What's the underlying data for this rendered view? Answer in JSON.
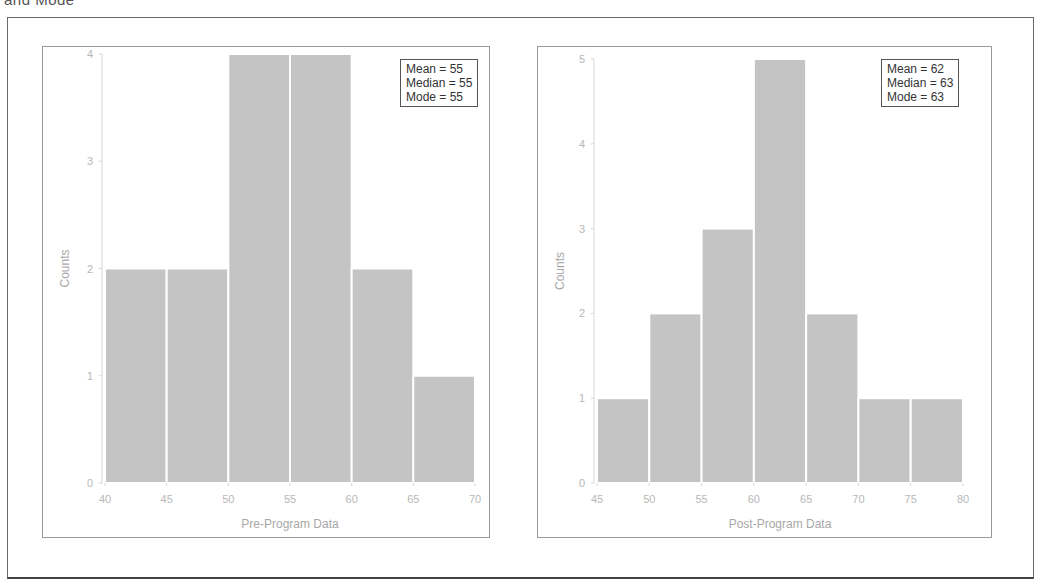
{
  "caption_fragment": "and Mode",
  "colors": {
    "bar_fill": "#c4c4c4",
    "bar_edge": "#ffffff",
    "axis": "#d6d6d6",
    "tick_text": "#b8b8b8",
    "frame": "#6a6a6a"
  },
  "chart_data": [
    {
      "type": "bar",
      "title": "",
      "xlabel": "Pre-Program Data",
      "ylabel": "Counts",
      "bins": [
        [
          40,
          45
        ],
        [
          45,
          50
        ],
        [
          50,
          55
        ],
        [
          55,
          60
        ],
        [
          60,
          65
        ],
        [
          65,
          70
        ]
      ],
      "categories": [
        "40-45",
        "45-50",
        "50-55",
        "55-60",
        "60-65",
        "65-70"
      ],
      "values": [
        2,
        2,
        4,
        4,
        2,
        1
      ],
      "xlim": [
        40,
        70
      ],
      "ylim": [
        0,
        4
      ],
      "xticks": [
        "40",
        "45",
        "50",
        "55",
        "60",
        "65",
        "70"
      ],
      "yticks": [
        "0",
        "1",
        "2",
        "3",
        "4"
      ],
      "grid": false,
      "annotation": {
        "mean": "Mean = 55",
        "median": "Median = 55",
        "mode": "Mode = 55"
      },
      "legend_position": "upper right"
    },
    {
      "type": "bar",
      "title": "",
      "xlabel": "Post-Program Data",
      "ylabel": "Counts",
      "bins": [
        [
          45,
          50
        ],
        [
          50,
          55
        ],
        [
          55,
          60
        ],
        [
          60,
          65
        ],
        [
          65,
          70
        ],
        [
          70,
          75
        ],
        [
          75,
          80
        ]
      ],
      "categories": [
        "45-50",
        "50-55",
        "55-60",
        "60-65",
        "65-70",
        "70-75",
        "75-80"
      ],
      "values": [
        1,
        2,
        3,
        5,
        2,
        1,
        1
      ],
      "xlim": [
        45,
        80
      ],
      "ylim": [
        0,
        5
      ],
      "xticks": [
        "45",
        "50",
        "55",
        "60",
        "65",
        "70",
        "75",
        "80"
      ],
      "yticks": [
        "0",
        "1",
        "2",
        "3",
        "4",
        "5"
      ],
      "grid": false,
      "annotation": {
        "mean": "Mean = 62",
        "median": "Median = 63",
        "mode": "Mode = 63"
      },
      "legend_position": "upper right"
    }
  ]
}
